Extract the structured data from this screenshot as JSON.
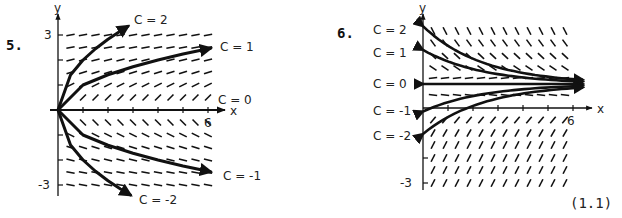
{
  "equation_ref": "(1.1)",
  "colors": {
    "ink": "#111111",
    "paper": "#ffffff"
  },
  "chart_data": [
    {
      "type": "line",
      "problem_number": "5.",
      "title": "Direction field with solution curves",
      "xlabel": "x",
      "ylabel": "y",
      "xlim": [
        0,
        6
      ],
      "ylim": [
        -3,
        3
      ],
      "x_tick_labels": [
        "6"
      ],
      "y_tick_labels": [
        "3",
        "-3"
      ],
      "x_ticks": [
        1,
        2,
        3,
        4,
        5,
        6
      ],
      "y_ticks": [
        -3,
        -2,
        -1,
        1,
        2,
        3
      ],
      "grid": false,
      "legend": "inline curve labels",
      "series": [
        {
          "name": "C = 2",
          "x": [
            0,
            0.5,
            1,
            1.5,
            2,
            2.5,
            2.8
          ],
          "y": [
            0,
            1.4,
            2.0,
            2.45,
            2.83,
            3.16,
            3.35
          ]
        },
        {
          "name": "C = 1",
          "x": [
            0,
            1,
            2,
            3,
            4,
            5,
            6.1
          ],
          "y": [
            0,
            1.0,
            1.41,
            1.73,
            2.0,
            2.24,
            2.47
          ]
        },
        {
          "name": "C = 0",
          "x": [
            0,
            6
          ],
          "y": [
            0,
            0
          ]
        },
        {
          "name": "C = -1",
          "x": [
            0,
            1,
            2,
            3,
            4,
            5,
            6.1
          ],
          "y": [
            0,
            -1.0,
            -1.41,
            -1.73,
            -2.0,
            -2.24,
            -2.47
          ]
        },
        {
          "name": "C = -2",
          "x": [
            0,
            0.5,
            1,
            1.5,
            2,
            2.5,
            2.9
          ],
          "y": [
            0,
            -1.4,
            -2.0,
            -2.45,
            -2.83,
            -3.16,
            -3.4
          ]
        }
      ],
      "field": {
        "rows": [
          -3,
          -2.5,
          -2,
          -1.5,
          -1,
          -0.5,
          0.5,
          1,
          1.5,
          2,
          2.5,
          3
        ],
        "cols": [
          0.5,
          1,
          1.5,
          2,
          2.5,
          3,
          3.5,
          4,
          4.5,
          5,
          5.5,
          6
        ],
        "slope_rule": "1/(2y)"
      }
    },
    {
      "type": "line",
      "problem_number": "6.",
      "title": "Direction field with solution curves",
      "xlabel": "x",
      "ylabel": "y",
      "xlim": [
        0,
        6
      ],
      "ylim": [
        -3,
        3
      ],
      "x_tick_labels": [
        "6"
      ],
      "y_tick_labels": [
        "-3"
      ],
      "x_ticks": [
        1,
        2,
        3,
        4,
        5,
        6
      ],
      "y_ticks": [
        -3,
        -2
      ],
      "grid": false,
      "legend": "labels at left of y-axis",
      "series": [
        {
          "name": "C = 2",
          "y0": 2.2,
          "x_end": 6.6
        },
        {
          "name": "C = 1",
          "y0": 1.3,
          "x_end": 6.6
        },
        {
          "name": "C = 0",
          "y0": 0.0,
          "x_end": 6.6
        },
        {
          "name": "C = -1",
          "y0": -1.1,
          "x_end": 6.6
        },
        {
          "name": "C = -2",
          "y0": -2.0,
          "x_end": 6.6
        }
      ],
      "field": {
        "note": "steep negative slopes above center line, positive slopes below; near-horizontal near center"
      }
    }
  ]
}
